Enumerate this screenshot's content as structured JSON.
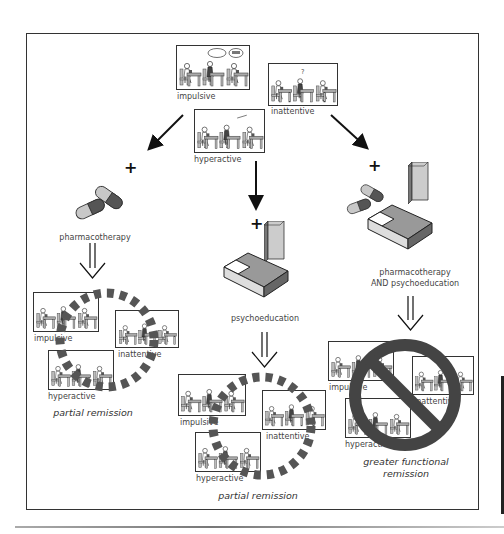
{
  "figure": {
    "symptoms": {
      "impulsive": "impulsive",
      "inattentive": "inattentive",
      "hyperactive": "hyperactive"
    },
    "speech_bubbles": {
      "know_it": "know it",
      "other": "blah"
    },
    "treatments": {
      "left": {
        "label": "pharmacotherapy",
        "operator": "+",
        "icon": "pill-capsules-icon"
      },
      "center": {
        "label": "psychoeducation",
        "operator": "+",
        "icon": "book-and-couch-icon"
      },
      "right": {
        "label_line1": "pharmacotherapy",
        "label_line2": "AND psychoeducation",
        "operator": "+",
        "icon": "pills-book-couch-icon"
      }
    },
    "outcomes": {
      "left": {
        "label": "partial remission",
        "overlay": "dashed-circle-icon"
      },
      "center": {
        "label": "partial remission",
        "overlay": "dashed-circle-icon"
      },
      "right": {
        "label_line1": "greater functional",
        "label_line2": "remission",
        "overlay": "prohibition-sign-icon"
      }
    },
    "colors": {
      "line": "#333333",
      "panel_gray": "#b8b8b8",
      "dark_gray": "#555555",
      "dashed_circle": "#555555",
      "no_sign": "#444444"
    }
  }
}
